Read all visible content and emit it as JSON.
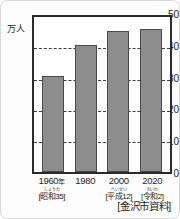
{
  "chart_data": {
    "type": "bar",
    "title": "",
    "subtitle": "",
    "xlabel": "",
    "ylabel": "万人",
    "ylim": [
      0,
      50
    ],
    "yticks": [
      0,
      10,
      20,
      30,
      40,
      50
    ],
    "ytick_labels": [
      "0",
      "10",
      "20",
      "30",
      "40",
      "50"
    ],
    "grid": true,
    "grid_axis": "y",
    "legend": false,
    "categories": [
      "1960年",
      "1980",
      "2000",
      "2020"
    ],
    "values": [
      31,
      41,
      45.5,
      46
    ],
    "bar_color": "#8d8d8d",
    "bar_edge_color": "#4a4a4a",
    "frame_color": "#2b2b2b",
    "annotations": [
      "[金沢市資料]"
    ]
  },
  "axis": {
    "unit_label": "万人",
    "y_ticks": [
      {
        "label": "50",
        "value": 50
      },
      {
        "label": "40",
        "value": 40
      },
      {
        "label": "30",
        "value": 30
      },
      {
        "label": "20",
        "value": 20
      },
      {
        "label": "10",
        "value": 10
      },
      {
        "label": "0",
        "value": 0
      }
    ]
  },
  "categories": [
    {
      "year": "1960",
      "year_suffix": "年",
      "era_ruby": "しょうわ",
      "era": "[昭和35]",
      "value": 31
    },
    {
      "year": "1980",
      "year_suffix": "",
      "era_ruby": "",
      "era": "",
      "value": 41
    },
    {
      "year": "2000",
      "year_suffix": "",
      "era_ruby": "へいせい",
      "era": "[平成12]",
      "value": 45.5
    },
    {
      "year": "2020",
      "year_suffix": "",
      "era_ruby": "れいわ",
      "era": "[令和2]",
      "value": 46
    }
  ],
  "source": "[金沢市資料]"
}
